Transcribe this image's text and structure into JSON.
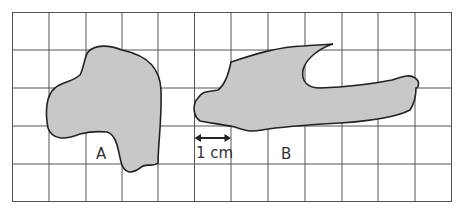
{
  "diagram": {
    "type": "grid-area-estimation",
    "grid": {
      "columns": 12,
      "rows": 5,
      "cell_unit": "1 cm"
    },
    "shapes": [
      {
        "id": "A",
        "label": "A",
        "fill": "#c8c8c8"
      },
      {
        "id": "B",
        "label": "B",
        "fill": "#c8c8c8"
      }
    ],
    "scale_label": "1 cm"
  }
}
